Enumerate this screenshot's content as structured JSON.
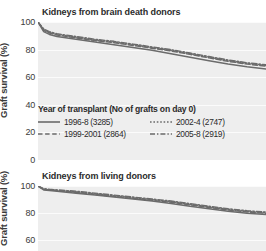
{
  "figure": {
    "axis_label": "Graft survival (%)",
    "accent_color": "#6b6b6b",
    "plot_bg": "#eeeeee",
    "grid_color": "#fbfbfb"
  },
  "legend": {
    "title": "Year of transplant (No of grafts on day 0)",
    "items": [
      {
        "label": "1996-8 (3285)",
        "style": "solid",
        "n": 3285,
        "period": "1996-8"
      },
      {
        "label": "2002-4 (2747)",
        "style": "dotted",
        "n": 2747,
        "period": "2002-4"
      },
      {
        "label": "1999-2001 (2864)",
        "style": "dashed",
        "n": 2864,
        "period": "1999-2001"
      },
      {
        "label": "2005-8 (2919)",
        "style": "dashdot",
        "n": 2919,
        "period": "2005-8"
      }
    ]
  },
  "panels": [
    {
      "title": "Kidneys from brain death donors",
      "ticks": [
        "100",
        "80",
        "60",
        "40",
        "20",
        "0"
      ]
    },
    {
      "title": "Kidneys from living donors",
      "ticks": [
        "100",
        "80",
        "60"
      ]
    }
  ],
  "chart_data": {
    "type": "line",
    "xlabel": "",
    "ylabel": "Graft survival (%)",
    "ylim": [
      0,
      100
    ],
    "grid": true,
    "legend_position": "inside-below-top-panel",
    "panels": [
      {
        "title": "Kidneys from brain death donors",
        "ylim": [
          0,
          100
        ],
        "yticks": [
          100,
          80,
          60,
          40,
          20,
          0
        ],
        "x": [
          0,
          0.3,
          0.6,
          1,
          2,
          3,
          4,
          5,
          6,
          7,
          8,
          9,
          10,
          11,
          12
        ],
        "series": [
          {
            "name": "1996-8 (3285)",
            "style": "solid",
            "values": [
              100,
              93,
              91,
              89.5,
              87.5,
              85.5,
              83.5,
              81.5,
              79.5,
              77,
              74.5,
              72,
              69.5,
              67.5,
              66
            ]
          },
          {
            "name": "1999-2001 (2864)",
            "style": "dashed",
            "values": [
              100,
              94,
              92,
              90.5,
              88.5,
              86.5,
              85,
              83,
              81,
              79,
              76.5,
              74,
              71.5,
              69.5,
              68
            ]
          },
          {
            "name": "2002-4 (2747)",
            "style": "dotted",
            "values": [
              100,
              94.5,
              92.5,
              91,
              89,
              87,
              85.5,
              83.5,
              81.5,
              79.5,
              77,
              74.5,
              72,
              70,
              68.5
            ]
          },
          {
            "name": "2005-8 (2919)",
            "style": "dashdot",
            "values": [
              100,
              95,
              93,
              91.5,
              89.5,
              87.5,
              86,
              84,
              82,
              80,
              77.5,
              75,
              72.5,
              70.5,
              69
            ]
          }
        ]
      },
      {
        "title": "Kidneys from living donors",
        "ylim": [
          50,
          100
        ],
        "yticks": [
          100,
          80,
          60
        ],
        "x": [
          0,
          0.3,
          0.6,
          1,
          2,
          3,
          4,
          5,
          6,
          7,
          8,
          9,
          10,
          11,
          12
        ],
        "series": [
          {
            "name": "1996-8 (3285)",
            "style": "solid",
            "values": [
              100,
              97,
              96.5,
              96,
              94.5,
              93,
              91.5,
              90,
              88.5,
              86.5,
              84.5,
              82.5,
              80.5,
              79,
              78
            ]
          },
          {
            "name": "1999-2001 (2864)",
            "style": "dashed",
            "values": [
              100,
              97.5,
              97,
              96.5,
              95,
              93.5,
              92,
              90.5,
              89,
              87.5,
              85.5,
              83.5,
              81.5,
              80,
              79
            ]
          },
          {
            "name": "2002-4 (2747)",
            "style": "dotted",
            "values": [
              100,
              97.5,
              97,
              96.5,
              95.5,
              94,
              92.5,
              91,
              89.5,
              88,
              86,
              84,
              82,
              80.5,
              79.5
            ]
          },
          {
            "name": "2005-8 (2919)",
            "style": "dashdot",
            "values": [
              100,
              98,
              97.5,
              97,
              96,
              94.5,
              93,
              91.5,
              90,
              88.5,
              86.5,
              84.5,
              82.5,
              81,
              80
            ]
          }
        ]
      }
    ]
  }
}
